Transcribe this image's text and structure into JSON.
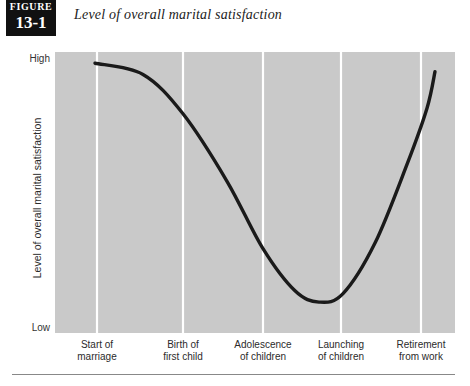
{
  "figure": {
    "badge_word": "FIGURE",
    "badge_number": "13-1",
    "title": "Level of overall marital satisfaction"
  },
  "axes": {
    "y_title": "Level of overall marital satisfaction",
    "y_ticks": [
      "High",
      "Low"
    ],
    "y_tick_high": "High",
    "y_tick_low": "Low"
  },
  "colors": {
    "plot_background": "#c9c9c9",
    "gridline": "#ffffff",
    "curve": "#1a1a1a",
    "badge_background": "#111111",
    "rule": "#888888"
  },
  "chart_data": {
    "type": "line",
    "title": "Level of overall marital satisfaction",
    "xlabel": "",
    "ylabel": "Level of overall marital satisfaction",
    "ylim": [
      0,
      1
    ],
    "ytick_labels": [
      "Low",
      "High"
    ],
    "grid": true,
    "grid_axis": "x",
    "legend": null,
    "categories": [
      "Start of marriage",
      "Birth of first child",
      "Adolescence of children",
      "Launching of children",
      "Retirement from work"
    ],
    "category_labels": [
      {
        "line1": "Start of",
        "line2": "marriage"
      },
      {
        "line1": "Birth of",
        "line2": "first child"
      },
      {
        "line1": "Adolescence",
        "line2": "of children"
      },
      {
        "line1": "Launching",
        "line2": "of children"
      },
      {
        "line1": "Retirement",
        "line2": "from work"
      }
    ],
    "series": [
      {
        "name": "Marital satisfaction",
        "values": [
          0.96,
          0.78,
          0.12,
          0.46,
          0.93
        ],
        "description": "U-shaped curve: high at start of marriage, declining to a minimum around adolescence of children, then rising again through launching of children to retirement from work."
      }
    ],
    "curve_points": [
      {
        "x": 0.1,
        "y": 0.96
      },
      {
        "x": 0.22,
        "y": 0.92
      },
      {
        "x": 0.32,
        "y": 0.78
      },
      {
        "x": 0.43,
        "y": 0.54
      },
      {
        "x": 0.52,
        "y": 0.3
      },
      {
        "x": 0.6,
        "y": 0.15
      },
      {
        "x": 0.66,
        "y": 0.11
      },
      {
        "x": 0.72,
        "y": 0.14
      },
      {
        "x": 0.8,
        "y": 0.32
      },
      {
        "x": 0.88,
        "y": 0.6
      },
      {
        "x": 0.93,
        "y": 0.8
      },
      {
        "x": 0.95,
        "y": 0.93
      }
    ],
    "gridline_positions": [
      0.105,
      0.32,
      0.52,
      0.715,
      0.915
    ]
  }
}
